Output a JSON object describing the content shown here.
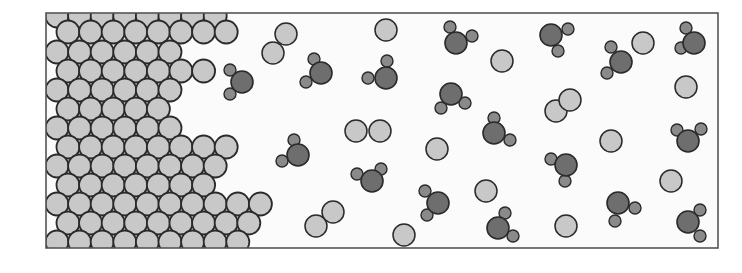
{
  "diagram": {
    "type": "molecular-model",
    "frame": {
      "x": 46,
      "y": 13,
      "width": 672,
      "height": 235
    },
    "colors": {
      "frame_stroke": "#555555",
      "background": "#fbfbfb",
      "light_atom_fill": "#c8c8c8",
      "dark_atom_fill": "#6e6e6e",
      "small_atom_fill": "#8a8a8a",
      "outline": "#2a2a2a"
    },
    "lattice": {
      "radius": 11.5,
      "col_pitch": 22.6,
      "rows": [
        {
          "y": 16,
          "x_start": 57,
          "x_end": 232
        },
        {
          "y": 32,
          "x_start": 68,
          "x_end": 244
        },
        {
          "y": 52,
          "x_start": 57,
          "x_end": 192
        },
        {
          "y": 71,
          "x_start": 68,
          "x_end": 210
        },
        {
          "y": 90,
          "x_start": 57,
          "x_end": 192
        },
        {
          "y": 109,
          "x_start": 68,
          "x_end": 180
        },
        {
          "y": 128,
          "x_start": 57,
          "x_end": 192
        },
        {
          "y": 147,
          "x_start": 68,
          "x_end": 244
        },
        {
          "y": 166,
          "x_start": 57,
          "x_end": 232
        },
        {
          "y": 185,
          "x_start": 68,
          "x_end": 222
        },
        {
          "y": 204,
          "x_start": 57,
          "x_end": 278
        },
        {
          "y": 223,
          "x_start": 68,
          "x_end": 266
        },
        {
          "y": 242,
          "x_start": 57,
          "x_end": 256
        }
      ]
    },
    "single_atoms": [
      {
        "x": 386,
        "y": 30
      },
      {
        "x": 502,
        "y": 61
      },
      {
        "x": 643,
        "y": 43
      },
      {
        "x": 686,
        "y": 87
      },
      {
        "x": 437,
        "y": 149
      },
      {
        "x": 611,
        "y": 141
      },
      {
        "x": 486,
        "y": 191
      },
      {
        "x": 671,
        "y": 181
      },
      {
        "x": 404,
        "y": 235
      },
      {
        "x": 566,
        "y": 226
      }
    ],
    "diatomic_pairs": [
      {
        "a": {
          "x": 286,
          "y": 34
        },
        "b": {
          "x": 273,
          "y": 53
        }
      },
      {
        "a": {
          "x": 356,
          "y": 131
        },
        "b": {
          "x": 380,
          "y": 131
        }
      },
      {
        "a": {
          "x": 570,
          "y": 100
        },
        "b": {
          "x": 556,
          "y": 111
        }
      },
      {
        "a": {
          "x": 333,
          "y": 212
        },
        "b": {
          "x": 316,
          "y": 226
        }
      }
    ],
    "triatomic_molecules": [
      {
        "c": {
          "x": 321,
          "y": 73
        },
        "h1": {
          "x": 314,
          "y": 59
        },
        "h2": {
          "x": 306,
          "y": 82
        }
      },
      {
        "c": {
          "x": 386,
          "y": 78
        },
        "h1": {
          "x": 387,
          "y": 61
        },
        "h2": {
          "x": 368,
          "y": 78
        }
      },
      {
        "c": {
          "x": 456,
          "y": 43
        },
        "h1": {
          "x": 450,
          "y": 27
        },
        "h2": {
          "x": 472,
          "y": 36
        }
      },
      {
        "c": {
          "x": 451,
          "y": 94
        },
        "h1": {
          "x": 441,
          "y": 108
        },
        "h2": {
          "x": 465,
          "y": 103
        }
      },
      {
        "c": {
          "x": 551,
          "y": 35
        },
        "h1": {
          "x": 568,
          "y": 29
        },
        "h2": {
          "x": 558,
          "y": 51
        }
      },
      {
        "c": {
          "x": 621,
          "y": 62
        },
        "h1": {
          "x": 611,
          "y": 47
        },
        "h2": {
          "x": 607,
          "y": 73
        }
      },
      {
        "c": {
          "x": 694,
          "y": 43
        },
        "h1": {
          "x": 686,
          "y": 28
        },
        "h2": {
          "x": 681,
          "y": 48
        }
      },
      {
        "c": {
          "x": 242,
          "y": 82
        },
        "h1": {
          "x": 230,
          "y": 70
        },
        "h2": {
          "x": 230,
          "y": 94
        }
      },
      {
        "c": {
          "x": 298,
          "y": 155
        },
        "h1": {
          "x": 294,
          "y": 140
        },
        "h2": {
          "x": 282,
          "y": 161
        }
      },
      {
        "c": {
          "x": 494,
          "y": 133
        },
        "h1": {
          "x": 494,
          "y": 118
        },
        "h2": {
          "x": 510,
          "y": 140
        }
      },
      {
        "c": {
          "x": 372,
          "y": 181
        },
        "h1": {
          "x": 357,
          "y": 174
        },
        "h2": {
          "x": 381,
          "y": 169
        }
      },
      {
        "c": {
          "x": 566,
          "y": 165
        },
        "h1": {
          "x": 551,
          "y": 159
        },
        "h2": {
          "x": 565,
          "y": 181
        }
      },
      {
        "c": {
          "x": 688,
          "y": 141
        },
        "h1": {
          "x": 677,
          "y": 130
        },
        "h2": {
          "x": 701,
          "y": 129
        }
      },
      {
        "c": {
          "x": 438,
          "y": 203
        },
        "h1": {
          "x": 425,
          "y": 191
        },
        "h2": {
          "x": 427,
          "y": 215
        }
      },
      {
        "c": {
          "x": 498,
          "y": 228
        },
        "h1": {
          "x": 505,
          "y": 213
        },
        "h2": {
          "x": 513,
          "y": 236
        }
      },
      {
        "c": {
          "x": 618,
          "y": 203
        },
        "h1": {
          "x": 635,
          "y": 208
        },
        "h2": {
          "x": 615,
          "y": 221
        }
      },
      {
        "c": {
          "x": 688,
          "y": 222
        },
        "h1": {
          "x": 700,
          "y": 210
        },
        "h2": {
          "x": 700,
          "y": 236
        }
      }
    ]
  }
}
